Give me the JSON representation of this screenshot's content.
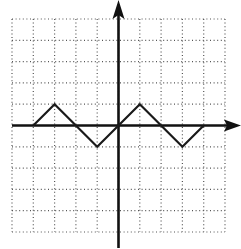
{
  "chart_data": {
    "type": "line",
    "title": "",
    "xlabel": "",
    "ylabel": "",
    "grid": true,
    "grid_style": "dotted",
    "xlim": [
      -5,
      5
    ],
    "ylim": [
      -5,
      5
    ],
    "grid_step": 1,
    "axes_arrows": [
      "positive-x",
      "positive-y"
    ],
    "series": [
      {
        "name": "zigzag",
        "x": [
          -4,
          -3,
          -2,
          -1,
          0,
          1,
          2,
          3,
          4
        ],
        "y": [
          0,
          1,
          0,
          -1,
          0,
          1,
          0,
          -1,
          0
        ]
      }
    ]
  },
  "layout": {
    "grid_left": 12,
    "grid_top": 19,
    "cell": 21.3,
    "origin_x": 118.5,
    "origin_y": 125.5,
    "colors": {
      "grid": "#555555",
      "axis": "#111111",
      "line": "#1a1a1a"
    }
  }
}
